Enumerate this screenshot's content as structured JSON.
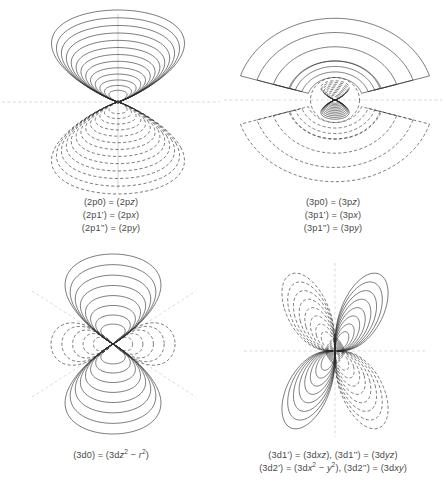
{
  "figure": {
    "title": "",
    "background": "#ffffff",
    "contour_color": "#2b2b2b",
    "axis_color": "#c0c0c0",
    "panel_count": 4
  },
  "panels": [
    {
      "id": "2p",
      "orbital": "2p",
      "caption_lines": [
        "(2p0) = (2pz)",
        "(2p1’) = (2px)",
        "(2p1’’) = (2py)"
      ],
      "lobes": [
        {
          "name": "upper-lobe",
          "sign": "positive",
          "style": "solid",
          "direction": "up"
        },
        {
          "name": "lower-lobe",
          "sign": "negative",
          "style": "dashed",
          "direction": "down"
        }
      ],
      "nodal_planes": [
        "horizontal"
      ],
      "contour_count": 13
    },
    {
      "id": "3p",
      "orbital": "3p",
      "caption_lines": [
        "(3p0) = (3pz)",
        "(3p1’) = (3px)",
        "(3p1’’) = (3py)"
      ],
      "lobes": [
        {
          "name": "inner-upper-lobe",
          "sign": "negative",
          "style": "dashed",
          "direction": "up"
        },
        {
          "name": "inner-lower-lobe",
          "sign": "positive",
          "style": "solid",
          "direction": "down"
        },
        {
          "name": "outer-upper-lobe",
          "sign": "positive",
          "style": "solid",
          "direction": "up"
        },
        {
          "name": "outer-lower-lobe",
          "sign": "negative",
          "style": "dashed",
          "direction": "down"
        }
      ],
      "nodal_planes": [
        "horizontal",
        "radial"
      ],
      "contour_count": 14
    },
    {
      "id": "3d0",
      "orbital": "3d0",
      "caption_lines": [
        "(3d0) = (3dz<sup>2</sup> − r<sup>2</sup>)"
      ],
      "caption_plain": "(3d0) = (3dz2 - r2)",
      "lobes": [
        {
          "name": "top-lobe",
          "sign": "positive",
          "style": "solid",
          "direction": "up"
        },
        {
          "name": "bottom-lobe",
          "sign": "positive",
          "style": "solid",
          "direction": "down"
        },
        {
          "name": "left-torus-lobe",
          "sign": "negative",
          "style": "dashed",
          "direction": "left"
        },
        {
          "name": "right-torus-lobe",
          "sign": "negative",
          "style": "dashed",
          "direction": "right"
        }
      ],
      "nodal_planes": [
        "diagonal-cone-up",
        "diagonal-cone-down"
      ],
      "contour_count": 8
    },
    {
      "id": "3d1",
      "orbital": "3d1",
      "caption_lines": [
        "(3d1’) = (3dxz), (3d1’’) = (3dyz)",
        "(3d2’) = (3dx<sup>2</sup> − y<sup>2</sup>), (3d2’’) = (3dxy)"
      ],
      "caption_plain_1": "(3d1') = (3dxz), (3d1'') = (3dyz)",
      "caption_plain_2": "(3d2') = (3dx2 - y2), (3d2'') = (3dxy)",
      "lobes": [
        {
          "name": "upper-left-lobe",
          "sign": "negative",
          "style": "dashed",
          "direction": "upper-left"
        },
        {
          "name": "upper-right-lobe",
          "sign": "positive",
          "style": "solid",
          "direction": "upper-right"
        },
        {
          "name": "lower-left-lobe",
          "sign": "positive",
          "style": "solid",
          "direction": "lower-left"
        },
        {
          "name": "lower-right-lobe",
          "sign": "negative",
          "style": "dashed",
          "direction": "lower-right"
        }
      ],
      "nodal_planes": [
        "horizontal",
        "vertical"
      ],
      "contour_count": 8
    }
  ],
  "chart_data": {
    "type": "contour",
    "panels": [
      "2p",
      "3p",
      "3d0",
      "3d1"
    ],
    "legend": {
      "solid": "positive amplitude",
      "dashed": "negative amplitude"
    }
  }
}
